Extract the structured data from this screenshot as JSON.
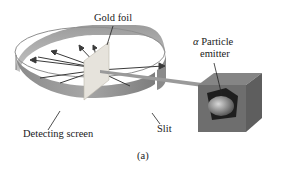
{
  "figure": {
    "caption": "(a)",
    "labels": {
      "gold_foil": "Gold foil",
      "alpha_symbol": "α",
      "particle": "Particle",
      "emitter": "emitter",
      "detecting_screen": "Detecting screen",
      "slit": "Slit"
    },
    "colors": {
      "screen_outer": "#8c8c8c",
      "screen_inner": "#b5b5b5",
      "foil": "#e6e3dc",
      "box": "#6e6e6e",
      "beam": "#9a9a9a",
      "arrow": "#3a3a3a"
    }
  }
}
